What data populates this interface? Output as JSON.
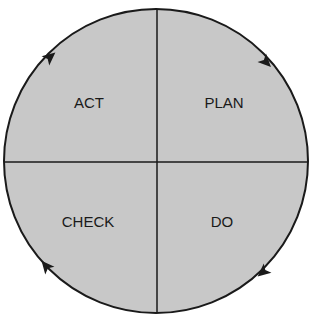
{
  "diagram": {
    "type": "PDCA cycle",
    "colors": {
      "fill": "#c8c8c8",
      "stroke": "#1a1a1a",
      "background": "#ffffff"
    },
    "quadrants": [
      {
        "position": "top-left",
        "label": "ACT"
      },
      {
        "position": "top-right",
        "label": "PLAN"
      },
      {
        "position": "bottom-right",
        "label": "DO"
      },
      {
        "position": "bottom-left",
        "label": "CHECK"
      }
    ],
    "arrows": {
      "direction": "clockwise",
      "count": 4
    }
  }
}
